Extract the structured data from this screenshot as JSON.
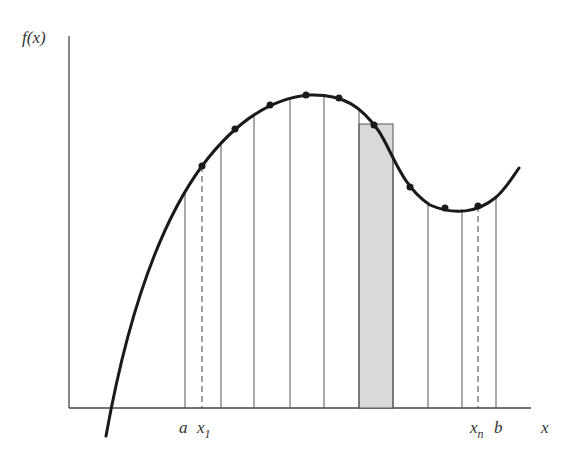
{
  "diagram": {
    "y_axis_label": "f(x)",
    "x_axis_label": "x",
    "x_ticks": {
      "a": "a",
      "x1_base": "x",
      "x1_sub": "1",
      "xn_base": "x",
      "xn_sub": "n",
      "b": "b"
    },
    "partition_lines_x": [
      185,
      221,
      254,
      290,
      324,
      359,
      393,
      428,
      462,
      496
    ],
    "dashed_lines_x": [
      202,
      478
    ],
    "sample_points": [
      [
        202,
        166
      ],
      [
        235,
        129
      ],
      [
        270,
        105
      ],
      [
        306,
        95
      ],
      [
        339,
        98
      ],
      [
        374,
        125
      ],
      [
        410,
        187
      ],
      [
        445,
        208
      ],
      [
        478,
        206
      ]
    ],
    "highlighted_rectangle": {
      "x_left": 359,
      "x_right": 393,
      "height_y": 124,
      "fill": "#d8d8d8"
    },
    "colors": {
      "curve": "#1a1a1a",
      "lines": "#555555",
      "axis": "#444444"
    }
  }
}
